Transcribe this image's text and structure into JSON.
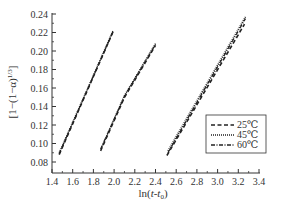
{
  "chart_data": {
    "type": "line",
    "title": "",
    "xlabel": "ln(t-t0)",
    "ylabel": "[1-(1-α)^(1/3)]",
    "xlim": [
      1.4,
      3.4
    ],
    "ylim": [
      0.068,
      0.24
    ],
    "xticks": [
      1.4,
      1.6,
      1.8,
      2.0,
      2.2,
      2.4,
      2.6,
      2.8,
      3.0,
      3.2,
      3.4
    ],
    "xtick_labels": [
      "1.4",
      "1.6",
      "1.8",
      "2.0",
      "2.2",
      "2.4",
      "2.6",
      "2.8",
      "3.0",
      "3.2",
      "3.4"
    ],
    "yticks": [
      0.08,
      0.1,
      0.12,
      0.14,
      0.16,
      0.18,
      0.2,
      0.22,
      0.24
    ],
    "ytick_labels": [
      "0.08",
      "0.10",
      "0.12",
      "0.14",
      "0.16",
      "0.18",
      "0.20",
      "0.22",
      "0.24"
    ],
    "grid": false,
    "legend_position": "lower right",
    "legend": [
      "25℃",
      "45℃",
      "60℃"
    ],
    "groups": [
      {
        "name": "group-left",
        "series": [
          {
            "name": "25℃",
            "style": "dashed",
            "x": [
              1.47,
              1.99
            ],
            "y": [
              0.088,
              0.221
            ]
          },
          {
            "name": "45℃",
            "style": "dotted",
            "x": [
              1.47,
              1.99
            ],
            "y": [
              0.09,
              0.222
            ]
          },
          {
            "name": "60℃",
            "style": "dashdot",
            "x": [
              1.47,
              1.99
            ],
            "y": [
              0.089,
              0.221
            ]
          }
        ]
      },
      {
        "name": "group-middle",
        "series": [
          {
            "name": "25℃",
            "style": "dashed",
            "x": [
              1.87,
              2.1,
              2.4
            ],
            "y": [
              0.092,
              0.15,
              0.206
            ]
          },
          {
            "name": "45℃",
            "style": "dotted",
            "x": [
              1.88,
              2.1,
              2.4
            ],
            "y": [
              0.096,
              0.152,
              0.208
            ]
          },
          {
            "name": "60℃",
            "style": "dashdot",
            "x": [
              1.87,
              2.1,
              2.4
            ],
            "y": [
              0.094,
              0.151,
              0.207
            ]
          }
        ]
      },
      {
        "name": "group-right",
        "series": [
          {
            "name": "25℃",
            "style": "dashed",
            "x": [
              2.51,
              3.26
            ],
            "y": [
              0.087,
              0.229
            ]
          },
          {
            "name": "45℃",
            "style": "dotted",
            "x": [
              2.52,
              3.27
            ],
            "y": [
              0.092,
              0.237
            ]
          },
          {
            "name": "60℃",
            "style": "dashdot",
            "x": [
              2.52,
              3.27
            ],
            "y": [
              0.09,
              0.235
            ]
          }
        ]
      }
    ]
  },
  "axes": {
    "xlabel_main": "ln(",
    "xlabel_t": "t",
    "xlabel_dash": "-",
    "xlabel_t0": "t",
    "xlabel_sub": "0",
    "xlabel_close": ")",
    "ylabel_main": "[1−(1−α)",
    "ylabel_sup": "1/3",
    "ylabel_close": "]"
  },
  "legend": {
    "items": [
      {
        "label": "25℃",
        "style": "dashed"
      },
      {
        "label": "45℃",
        "style": "dotted"
      },
      {
        "label": "60℃",
        "style": "dashdot"
      }
    ]
  }
}
